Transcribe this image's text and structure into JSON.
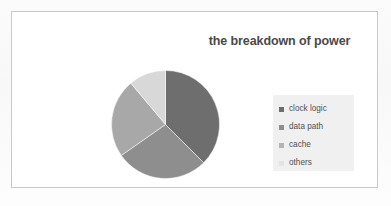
{
  "chart_data": {
    "type": "pie",
    "title": "the breakdown of power",
    "categories": [
      "clock logic",
      "data path",
      "cache",
      "others"
    ],
    "values": [
      37.5,
      27.8,
      23.6,
      11.1
    ],
    "angles_deg": [
      135,
      100,
      85,
      40
    ],
    "colors": [
      "#6e6e6e",
      "#8e8e8e",
      "#a8a8a8",
      "#d8d8d8"
    ],
    "start_angle_deg": 0,
    "direction": "clockwise",
    "legend_position": "right",
    "grid": false,
    "xlabel": "",
    "ylabel": ""
  },
  "legend": {
    "items": [
      {
        "label": "clock logic",
        "color": "#6e6e6e"
      },
      {
        "label": "data path",
        "color": "#8e8e8e"
      },
      {
        "label": "cache",
        "color": "#b4b4b4"
      },
      {
        "label": "others",
        "color": "#e4e4e4"
      }
    ]
  }
}
